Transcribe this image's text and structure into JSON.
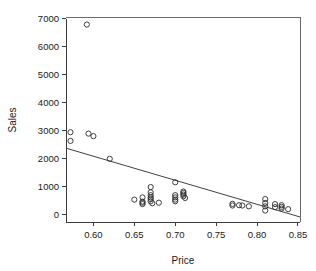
{
  "chart_data": {
    "type": "scatter",
    "title": "",
    "xlabel": "Price",
    "ylabel": "Sales",
    "xlim": [
      0.5665,
      0.8525
    ],
    "ylim": [
      -260,
      7070
    ],
    "grid": false,
    "legend": null,
    "xticks": [
      0.6,
      0.65,
      0.7,
      0.75,
      0.8,
      0.85
    ],
    "xticklabels": [
      "0.60",
      "0.65",
      "0.70",
      "0.75",
      "0.80",
      "0.85"
    ],
    "yticks": [
      0,
      1000,
      2000,
      3000,
      4000,
      5000,
      6000,
      7000
    ],
    "yticklabels": [
      "0",
      "1000",
      "2000",
      "3000",
      "4000",
      "5000",
      "6000",
      "7000"
    ],
    "marker_style": "open-circle",
    "marker_radius_px": 2.6,
    "points": [
      {
        "x": 0.572,
        "y": 2950
      },
      {
        "x": 0.572,
        "y": 2640
      },
      {
        "x": 0.592,
        "y": 6800
      },
      {
        "x": 0.594,
        "y": 2900
      },
      {
        "x": 0.6,
        "y": 2810
      },
      {
        "x": 0.62,
        "y": 2000
      },
      {
        "x": 0.65,
        "y": 540
      },
      {
        "x": 0.66,
        "y": 620
      },
      {
        "x": 0.66,
        "y": 470
      },
      {
        "x": 0.66,
        "y": 430
      },
      {
        "x": 0.66,
        "y": 380
      },
      {
        "x": 0.67,
        "y": 990
      },
      {
        "x": 0.67,
        "y": 800
      },
      {
        "x": 0.67,
        "y": 700
      },
      {
        "x": 0.67,
        "y": 620
      },
      {
        "x": 0.67,
        "y": 560
      },
      {
        "x": 0.67,
        "y": 480
      },
      {
        "x": 0.672,
        "y": 410
      },
      {
        "x": 0.68,
        "y": 430
      },
      {
        "x": 0.7,
        "y": 1160
      },
      {
        "x": 0.7,
        "y": 700
      },
      {
        "x": 0.7,
        "y": 620
      },
      {
        "x": 0.7,
        "y": 540
      },
      {
        "x": 0.7,
        "y": 480
      },
      {
        "x": 0.71,
        "y": 830
      },
      {
        "x": 0.71,
        "y": 780
      },
      {
        "x": 0.71,
        "y": 720
      },
      {
        "x": 0.71,
        "y": 660
      },
      {
        "x": 0.712,
        "y": 600
      },
      {
        "x": 0.77,
        "y": 390
      },
      {
        "x": 0.77,
        "y": 330
      },
      {
        "x": 0.778,
        "y": 340
      },
      {
        "x": 0.782,
        "y": 330
      },
      {
        "x": 0.79,
        "y": 300
      },
      {
        "x": 0.81,
        "y": 560
      },
      {
        "x": 0.81,
        "y": 420
      },
      {
        "x": 0.81,
        "y": 300
      },
      {
        "x": 0.81,
        "y": 150
      },
      {
        "x": 0.822,
        "y": 380
      },
      {
        "x": 0.822,
        "y": 270
      },
      {
        "x": 0.83,
        "y": 340
      },
      {
        "x": 0.83,
        "y": 280
      },
      {
        "x": 0.83,
        "y": 220
      },
      {
        "x": 0.838,
        "y": 200
      }
    ],
    "fit_line": {
      "x0": 0.5665,
      "y0": 2380,
      "x1": 0.8525,
      "y1": -80
    }
  }
}
